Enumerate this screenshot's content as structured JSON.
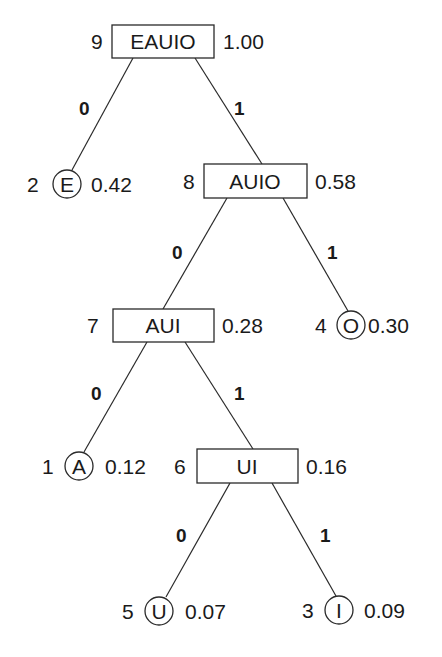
{
  "diagram": {
    "type": "huffman-tree",
    "nodes": [
      {
        "id": "n9",
        "kind": "internal",
        "order": "9",
        "label": "EAUIO",
        "prob": "1.00",
        "x": 112,
        "y": 25,
        "w": 102,
        "h": 33
      },
      {
        "id": "n8",
        "kind": "internal",
        "order": "8",
        "label": "AUIO",
        "prob": "0.58",
        "x": 204,
        "y": 164,
        "w": 103,
        "h": 34
      },
      {
        "id": "n7",
        "kind": "internal",
        "order": "7",
        "label": "AUI",
        "prob": "0.28",
        "x": 113,
        "y": 309,
        "w": 101,
        "h": 33
      },
      {
        "id": "n6",
        "kind": "internal",
        "order": "6",
        "label": "UI",
        "prob": "0.16",
        "x": 197,
        "y": 449,
        "w": 101,
        "h": 34
      },
      {
        "id": "n2",
        "kind": "leaf",
        "order": "2",
        "label": "E",
        "prob": "0.42",
        "cx": 67,
        "cy": 184
      },
      {
        "id": "n4",
        "kind": "leaf",
        "order": "4",
        "label": "O",
        "prob": "0.30",
        "cx": 351,
        "cy": 325
      },
      {
        "id": "n1",
        "kind": "leaf",
        "order": "1",
        "label": "A",
        "prob": "0.12",
        "cx": 79,
        "cy": 466
      },
      {
        "id": "n5",
        "kind": "leaf",
        "order": "5",
        "label": "U",
        "prob": "0.07",
        "cx": 159,
        "cy": 611
      },
      {
        "id": "n3",
        "kind": "leaf",
        "order": "3",
        "label": "I",
        "prob": "0.09",
        "cx": 339,
        "cy": 610
      }
    ],
    "edges": [
      {
        "from": "EAUIO",
        "to": "E",
        "bit": "0"
      },
      {
        "from": "EAUIO",
        "to": "AUIO",
        "bit": "1"
      },
      {
        "from": "AUIO",
        "to": "AUI",
        "bit": "0"
      },
      {
        "from": "AUIO",
        "to": "O",
        "bit": "1"
      },
      {
        "from": "AUI",
        "to": "A",
        "bit": "0"
      },
      {
        "from": "AUI",
        "to": "UI",
        "bit": "1"
      },
      {
        "from": "UI",
        "to": "U",
        "bit": "0"
      },
      {
        "from": "UI",
        "to": "I",
        "bit": "1"
      }
    ],
    "colors": {
      "stroke": "#2a2a2a",
      "text": "#1a1a1a",
      "background": "#ffffff"
    }
  }
}
